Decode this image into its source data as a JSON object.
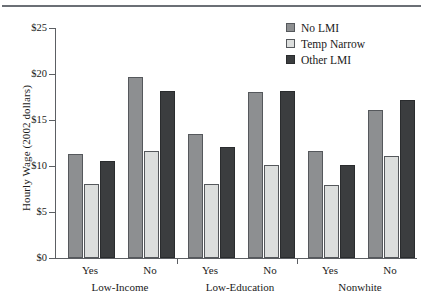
{
  "figure": {
    "top_rule": true
  },
  "chart_data": {
    "type": "bar",
    "title": "",
    "xlabel": "",
    "ylabel": "Hourly Wage (2002 dollars)",
    "ylim": [
      0,
      25
    ],
    "yticks": [
      0,
      5,
      10,
      15,
      20,
      25
    ],
    "ytick_labels": [
      "$0",
      "$5",
      "$10",
      "$15",
      "$20",
      "$25"
    ],
    "grid": false,
    "legend_position": "top-right",
    "categories": [
      "Yes",
      "No",
      "Yes",
      "No",
      "Yes",
      "No"
    ],
    "groups": [
      {
        "name": "Low-Income",
        "categories": [
          "Yes",
          "No"
        ]
      },
      {
        "name": "Low-Education",
        "categories": [
          "Yes",
          "No"
        ]
      },
      {
        "name": "Nonwhite",
        "categories": [
          "Yes",
          "No"
        ]
      }
    ],
    "series": [
      {
        "name": "No LMI",
        "color": "#8d8f91",
        "values": [
          11.3,
          19.7,
          13.5,
          18.0,
          11.6,
          16.1
        ]
      },
      {
        "name": "Temp Narrow",
        "color": "#dcdedd",
        "values": [
          8.0,
          11.6,
          8.0,
          10.1,
          7.9,
          11.1
        ]
      },
      {
        "name": "Other LMI",
        "color": "#3b3d3f",
        "values": [
          10.5,
          18.2,
          12.1,
          18.2,
          10.1,
          17.2
        ]
      }
    ]
  }
}
